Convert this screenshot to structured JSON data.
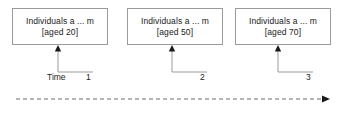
{
  "diagram": {
    "title": "",
    "background_color": "#ffffff",
    "line_color": "#9b9b9b",
    "text_color": "#1a1a1a",
    "nodes": [
      {
        "id": "node-1",
        "line1": "Individuals a ... m",
        "line2": "[aged 20]",
        "x": 12,
        "y": 8,
        "width": 96,
        "height": 37
      },
      {
        "id": "node-2",
        "line1": "Individuals a ... m",
        "line2": "[aged 50]",
        "x": 127,
        "y": 8,
        "width": 96,
        "height": 37
      },
      {
        "id": "node-3",
        "line1": "Individuals a ... m",
        "line2": "[aged 70]",
        "x": 235,
        "y": 8,
        "width": 96,
        "height": 37
      }
    ],
    "connectors": [
      {
        "id": "connector-1",
        "arrow_x": 58,
        "arrow_top_y": 45,
        "corner_y": 72,
        "end_x": 93
      },
      {
        "id": "connector-2",
        "arrow_x": 172,
        "arrow_top_y": 45,
        "corner_y": 72,
        "end_x": 207
      },
      {
        "id": "connector-3",
        "arrow_x": 278,
        "arrow_top_y": 45,
        "corner_y": 72,
        "end_x": 313
      }
    ],
    "tick_labels": [
      {
        "id": "tick-1",
        "text": "1",
        "x": 86,
        "y": 72
      },
      {
        "id": "tick-2",
        "text": "2",
        "x": 200,
        "y": 72
      },
      {
        "id": "tick-3",
        "text": "3",
        "x": 306,
        "y": 72
      }
    ],
    "time_label": {
      "text": "Time",
      "x": 47,
      "y": 72
    },
    "timeline": {
      "id": "timeline-axis",
      "start_x": 16,
      "end_x": 330,
      "y": 99,
      "style": "dashed",
      "arrow": "right"
    }
  }
}
